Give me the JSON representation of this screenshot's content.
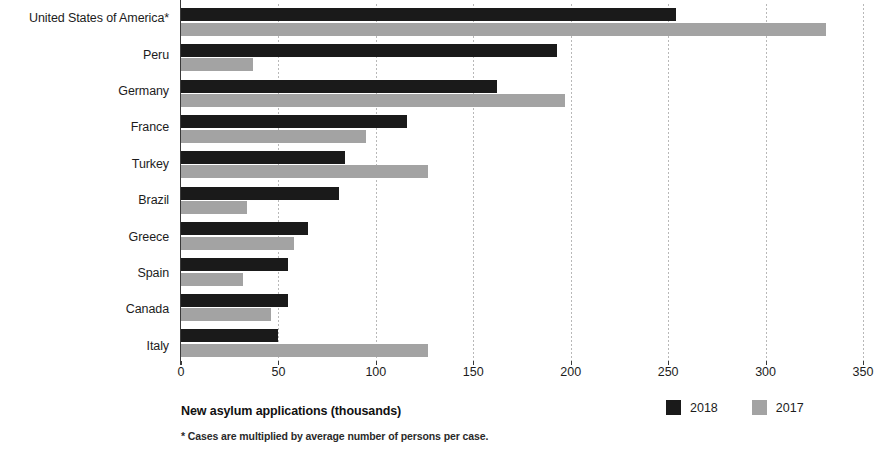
{
  "chart_data": {
    "type": "bar",
    "orientation": "horizontal",
    "title": "",
    "xlabel": "New asylum applications (thousands)",
    "ylabel": "",
    "xlim": [
      0,
      350
    ],
    "xticks": [
      0,
      50,
      100,
      150,
      200,
      250,
      300,
      350
    ],
    "grid": true,
    "legend_position": "bottom-right",
    "categories": [
      "United States of America*",
      "Peru",
      "Germany",
      "France",
      "Turkey",
      "Brazil",
      "Greece",
      "Spain",
      "Canada",
      "Italy"
    ],
    "series": [
      {
        "name": "2018",
        "color": "#1a1a1a",
        "values": [
          254,
          193,
          162,
          116,
          84,
          81,
          65,
          55,
          55,
          50
        ]
      },
      {
        "name": "2017",
        "color": "#a3a3a3",
        "values": [
          331,
          37,
          197,
          95,
          127,
          34,
          58,
          32,
          46,
          127
        ]
      }
    ],
    "footnote": "* Cases are multiplied by average number of persons per case."
  },
  "axis": {
    "x_title": "New asylum applications (thousands)",
    "tick_labels": [
      "0",
      "50",
      "100",
      "150",
      "200",
      "250",
      "300",
      "350"
    ]
  },
  "legend": {
    "items": [
      {
        "label": "2018",
        "color": "#1a1a1a"
      },
      {
        "label": "2017",
        "color": "#a3a3a3"
      }
    ]
  },
  "footnote": {
    "text": "* Cases are multiplied by average number of persons per case."
  }
}
